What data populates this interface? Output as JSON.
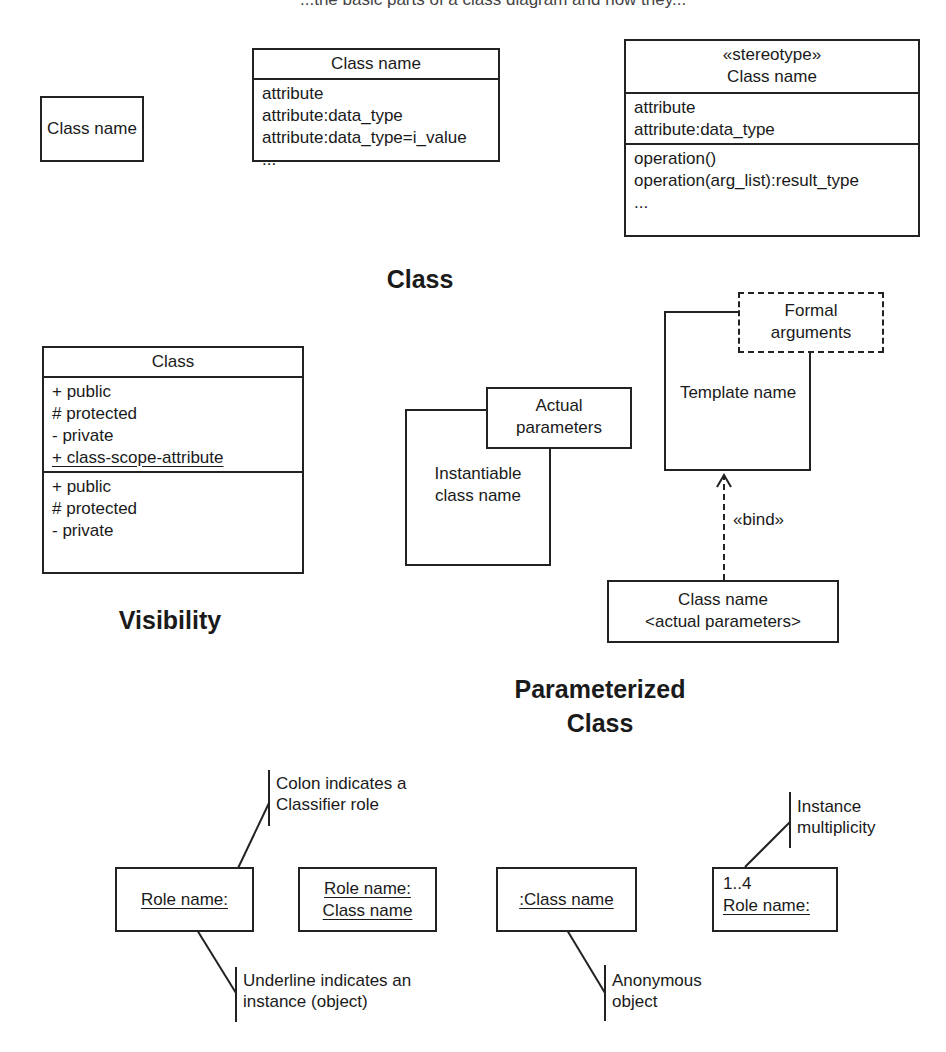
{
  "header_fragment": "...the basic parts of a class diagram and how they...",
  "class_section": {
    "title": "Class",
    "simple_box": {
      "name": "Class name"
    },
    "attr_box": {
      "name": "Class name",
      "attributes": [
        "attribute",
        "attribute:data_type",
        "attribute:data_type=i_value",
        "..."
      ]
    },
    "full_box": {
      "stereotype": "«stereotype»",
      "name": "Class name",
      "attributes": [
        "attribute",
        "attribute:data_type"
      ],
      "operations": [
        "operation()",
        "operation(arg_list):result_type",
        "..."
      ]
    }
  },
  "visibility_section": {
    "title": "Visibility",
    "box": {
      "name": "Class",
      "attributes": [
        "+ public",
        "# protected",
        "- private",
        "+ class-scope-attribute"
      ],
      "operations": [
        "+ public",
        "# protected",
        "- private"
      ]
    }
  },
  "parameterized_section": {
    "title_line1": "Parameterized",
    "title_line2": "Class",
    "instantiable": {
      "name_line1": "Instantiable",
      "name_line2": "class name",
      "params_line1": "Actual",
      "params_line2": "parameters"
    },
    "template": {
      "name": "Template name",
      "formal_line1": "Formal",
      "formal_line2": "arguments"
    },
    "bind_label": "«bind»",
    "bound_class": {
      "line1": "Class name",
      "line2": "<actual parameters>"
    }
  },
  "object_section": {
    "role_box": {
      "label": "Role name:"
    },
    "role_class_box": {
      "line1": "Role name:",
      "line2": "Class name"
    },
    "anon_box": {
      "label": ":Class name"
    },
    "multi_box": {
      "multiplicity": "1..4",
      "label": "Role name:"
    },
    "notes": {
      "colon_line1": "Colon indicates a",
      "colon_line2": "Classifier role",
      "underline_line1": "Underline indicates an",
      "underline_line2": "instance (object)",
      "anon_line1": "Anonymous",
      "anon_line2": "object",
      "multi_line1": "Instance",
      "multi_line2": "multiplicity"
    }
  }
}
